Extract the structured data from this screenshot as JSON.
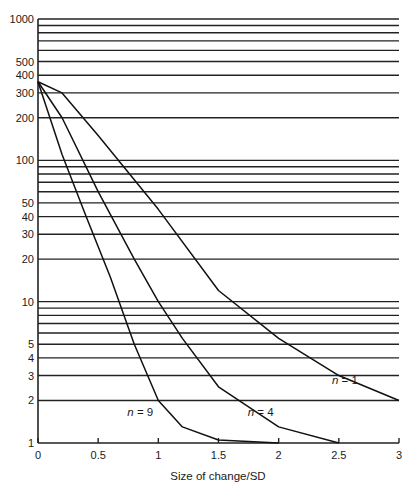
{
  "chart_data": {
    "type": "line",
    "title": "",
    "xlabel": "Size of change/SD",
    "ylabel": "",
    "xlim": [
      0,
      3
    ],
    "ylim": [
      1,
      1000
    ],
    "yscale": "log",
    "grid": "horizontal",
    "x_ticks": [
      0,
      0.5,
      1,
      1.5,
      2,
      2.5,
      3
    ],
    "x_tick_labels": [
      "0",
      "0.5",
      "1",
      "1.5",
      "2",
      "2.5",
      "3"
    ],
    "y_ticks_labeled": [
      1,
      2,
      3,
      4,
      5,
      10,
      20,
      30,
      40,
      50,
      100,
      200,
      300,
      400,
      500,
      1000
    ],
    "y_tick_labels": [
      "1",
      "2",
      "3",
      "4",
      "5",
      "10",
      "20",
      "30",
      "40",
      "50",
      "100",
      "200",
      "300",
      "400",
      "500",
      "1000"
    ],
    "y_gridlines": [
      2,
      3,
      4,
      5,
      6,
      7,
      8,
      9,
      10,
      20,
      30,
      40,
      50,
      60,
      70,
      80,
      90,
      100,
      200,
      300,
      400,
      500,
      600,
      700,
      800,
      900,
      1000
    ],
    "series": [
      {
        "name": "n = 1",
        "x": [
          0,
          0.2,
          0.5,
          1.0,
          1.5,
          2.0,
          2.5,
          3.0
        ],
        "values": [
          360,
          300,
          150,
          45,
          12,
          5.5,
          3.0,
          2.0
        ]
      },
      {
        "name": "n = 4",
        "x": [
          0,
          0.2,
          0.5,
          0.8,
          1.0,
          1.2,
          1.5,
          2.0,
          2.5
        ],
        "values": [
          360,
          200,
          60,
          20,
          10,
          5.5,
          2.5,
          1.3,
          1.0
        ]
      },
      {
        "name": "n = 9",
        "x": [
          0,
          0.2,
          0.4,
          0.6,
          0.8,
          1.0,
          1.2,
          1.5,
          2.0
        ],
        "values": [
          360,
          110,
          40,
          15,
          5,
          2.0,
          1.3,
          1.05,
          1.0
        ]
      }
    ],
    "annotations": [
      {
        "text": "n = 1",
        "x": 2.55,
        "y": 2.6
      },
      {
        "text": "n = 4",
        "x": 1.85,
        "y": 1.55
      },
      {
        "text": "n = 9",
        "x": 0.85,
        "y": 1.55
      }
    ]
  }
}
